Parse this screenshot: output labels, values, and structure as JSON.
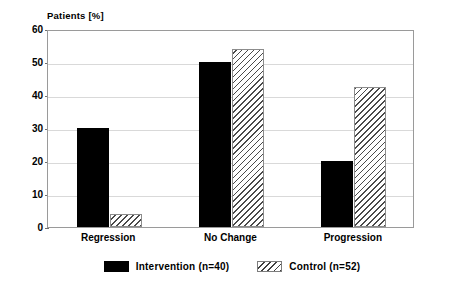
{
  "chart_data": {
    "type": "bar",
    "title": "",
    "ylabel": "Patients [%]",
    "xlabel": "",
    "categories": [
      "Regression",
      "No Change",
      "Progression"
    ],
    "series": [
      {
        "name": "Intervention (n=40)",
        "pattern": "solid-black",
        "color": "#000000",
        "values": [
          30,
          50,
          20
        ]
      },
      {
        "name": "Control (n=52)",
        "pattern": "diagonal-hatch",
        "color": "#ffffff",
        "values": [
          4,
          54,
          42.5
        ]
      }
    ],
    "ylim": [
      0,
      60
    ],
    "yticks": [
      0,
      10,
      20,
      30,
      40,
      50,
      60
    ],
    "ytick_labels": [
      "0",
      "10",
      "20",
      "30",
      "40",
      "50",
      "60"
    ],
    "grid": true,
    "legend_position": "bottom-center"
  },
  "legend": {
    "entries": [
      {
        "label": "Intervention (n=40)",
        "swatch": "solid-black-swatch"
      },
      {
        "label": "Control (n=52)",
        "swatch": "hatched-swatch"
      }
    ]
  }
}
